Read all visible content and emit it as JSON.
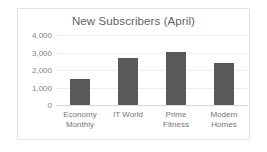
{
  "chart_data": {
    "type": "bar",
    "title": "New Subscribers (April)",
    "xlabel": "",
    "ylabel": "",
    "categories": [
      "Economy Monthly",
      "IT World",
      "Prime Fitness",
      "Modern Homes"
    ],
    "values": [
      1500,
      2700,
      3050,
      2400
    ],
    "ylim": [
      0,
      4000
    ],
    "ytick_labels": [
      "4,000",
      "3,000",
      "2,000",
      "1,000",
      "0"
    ],
    "ytick_values": [
      4000,
      3000,
      2000,
      1000,
      0
    ],
    "grid": true,
    "legend": false,
    "bar_color": "#595959",
    "gridline_color": "#ededed",
    "axis_color": "#d8d8d8",
    "title_color": "#5f5f5f",
    "tick_label_color": "#828282",
    "category_label_color": "#767676",
    "frame_border_color": "#e3e3e3",
    "background_color": "#ffffff"
  }
}
